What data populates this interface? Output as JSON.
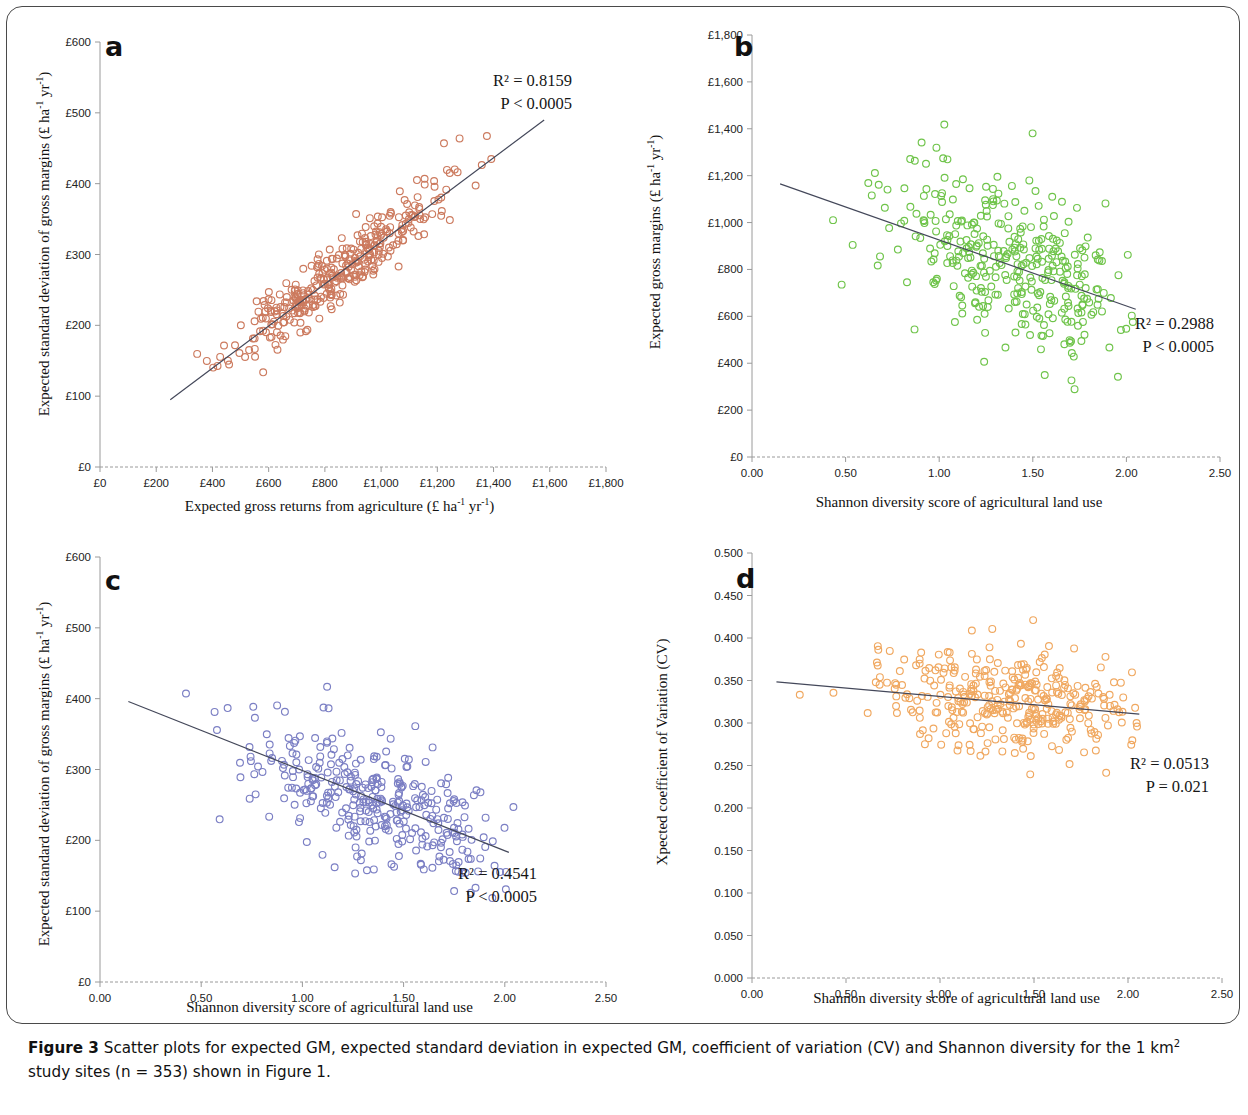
{
  "caption": {
    "prefix": "Figure 3",
    "text_part1": " Scatter plots for expected GM, expected standard deviation in expected GM, coefficient of variation (CV) and Shannon diversity for the 1 km",
    "superscript": "2",
    "text_part2": " study sites (n = 353) shown in Figure 1."
  },
  "colors": {
    "panel_a_marker": "#cc7a5e",
    "panel_b_marker": "#6fc44a",
    "panel_c_marker": "#7b7fc4",
    "panel_d_marker": "#f0a860",
    "trendline": "#44485a",
    "axis": "#9a9a9a",
    "text": "#111111"
  },
  "chart_data": [
    {
      "id": "panel-a",
      "type": "scatter",
      "letter": "a",
      "title": "",
      "xlabel": "Expected gross returns from agriculture (£ ha-1 yr-1)",
      "xlabel_display": "Expected gross returns from agriculture (£ ha",
      "ylabel": "Expected standard deviation of gross margins (£ ha-1 yr-1)",
      "ylabel_display": "Expected standard deviation of gross margins (£ ha",
      "xlim": [
        0,
        1800
      ],
      "ylim": [
        0,
        600
      ],
      "xticks": [
        "£0",
        "£200",
        "£400",
        "£600",
        "£800",
        "£1,000",
        "£1,200",
        "£1,400",
        "£1,600",
        "£1,800"
      ],
      "xtick_values": [
        0,
        200,
        400,
        600,
        800,
        1000,
        1200,
        1400,
        1600,
        1800
      ],
      "yticks": [
        "£0",
        "£100",
        "£200",
        "£300",
        "£400",
        "£500",
        "£600"
      ],
      "ytick_values": [
        0,
        100,
        200,
        300,
        400,
        500,
        600
      ],
      "r2_label": "R² = 0.8159",
      "r2_value": 0.8159,
      "p_label": "P < 0.0005",
      "grid": false,
      "legend": "none",
      "marker_color": "#cc7a5e",
      "trend": {
        "x0": 250,
        "y0": 95,
        "x1": 1580,
        "y1": 490
      },
      "n": 353,
      "seed": 11,
      "distribution": {
        "model": "linear_cluster",
        "x_mean": 840,
        "x_sd": 185,
        "x_min": 250,
        "x_max": 1590,
        "slope": 0.297,
        "intercept": 21,
        "resid_sd": 21
      }
    },
    {
      "id": "panel-b",
      "type": "scatter",
      "letter": "b",
      "title": "",
      "xlabel": "Shannon diversity score of agricultural land use",
      "ylabel": "Expected gross margins (£ ha-1 yr-1)",
      "ylabel_display": "Expected gross margins (£ ha",
      "xlim": [
        0,
        2.5
      ],
      "ylim": [
        0,
        1800
      ],
      "xticks": [
        "0.00",
        "0.50",
        "1.00",
        "1.50",
        "2.00",
        "2.50"
      ],
      "xtick_values": [
        0,
        0.5,
        1.0,
        1.5,
        2.0,
        2.5
      ],
      "yticks": [
        "£0",
        "£200",
        "£400",
        "£600",
        "£800",
        "£1,000",
        "£1,200",
        "£1,400",
        "£1,600",
        "£1,800"
      ],
      "ytick_values": [
        0,
        200,
        400,
        600,
        800,
        1000,
        1200,
        1400,
        1600,
        1800
      ],
      "r2_label": "R² = 0.2988",
      "r2_value": 0.2988,
      "p_label": "P < 0.0005",
      "grid": false,
      "legend": "none",
      "marker_color": "#6fc44a",
      "trend": {
        "x0": 0.15,
        "y0": 1165,
        "x1": 2.05,
        "y1": 630
      },
      "n": 353,
      "seed": 23,
      "distribution": {
        "model": "linear_cluster",
        "x_mean": 1.38,
        "x_sd": 0.33,
        "x_min": 0.14,
        "x_max": 2.05,
        "slope": -282,
        "intercept": 1207,
        "resid_sd": 175
      }
    },
    {
      "id": "panel-c",
      "type": "scatter",
      "letter": "c",
      "title": "",
      "xlabel": "Shannon diversity score of agricultural land use",
      "ylabel": "Expected standard deviation of gross margins (£ ha-1 yr-1)",
      "ylabel_display": "Expected standard deviation of gross margins (£ ha",
      "xlim": [
        0,
        2.5
      ],
      "ylim": [
        0,
        600
      ],
      "xticks": [
        "0.00",
        "0.50",
        "1.00",
        "1.50",
        "2.00",
        "2.50"
      ],
      "xtick_values": [
        0,
        0.5,
        1.0,
        1.5,
        2.0,
        2.5
      ],
      "yticks": [
        "£0",
        "£100",
        "£200",
        "£300",
        "£400",
        "£500",
        "£600"
      ],
      "ytick_values": [
        0,
        100,
        200,
        300,
        400,
        500,
        600
      ],
      "r2_label": "R² = 0.4541",
      "r2_value": 0.4541,
      "p_label": "P < 0.0005",
      "grid": false,
      "legend": "none",
      "marker_color": "#7b7fc4",
      "trend": {
        "x0": 0.14,
        "y0": 396,
        "x1": 2.02,
        "y1": 183
      },
      "n": 353,
      "seed": 37,
      "distribution": {
        "model": "linear_cluster",
        "x_mean": 1.38,
        "x_sd": 0.33,
        "x_min": 0.12,
        "x_max": 2.05,
        "slope": -113,
        "intercept": 412,
        "resid_sd": 43
      }
    },
    {
      "id": "panel-d",
      "type": "scatter",
      "letter": "d",
      "title": "",
      "xlabel": "Shannon diversity score of agricultural land use",
      "ylabel": "Xpected coefficient of Variation (CV)",
      "ylabel_display": "Xpected coefficient of Variation (CV)",
      "xlim": [
        0,
        2.5
      ],
      "ylim": [
        0,
        0.5
      ],
      "xticks": [
        "0.00",
        "0.50",
        "1.00",
        "1.50",
        "2.00",
        "2.50"
      ],
      "xtick_values": [
        0,
        0.5,
        1.0,
        1.5,
        2.0,
        2.5
      ],
      "yticks": [
        "0.000",
        "0.050",
        "0.100",
        "0.150",
        "0.200",
        "0.250",
        "0.300",
        "0.350",
        "0.400",
        "0.450",
        "0.500"
      ],
      "ytick_values": [
        0,
        0.05,
        0.1,
        0.15,
        0.2,
        0.25,
        0.3,
        0.35,
        0.4,
        0.45,
        0.5
      ],
      "r2_label": "R² = 0.0513",
      "r2_value": 0.0513,
      "p_label": "P = 0.021",
      "grid": false,
      "legend": "none",
      "marker_color": "#f0a860",
      "trend": {
        "x0": 0.13,
        "y0": 0.3485,
        "x1": 2.06,
        "y1": 0.3105
      },
      "n": 353,
      "seed": 53,
      "distribution": {
        "model": "linear_cluster",
        "x_mean": 1.38,
        "x_sd": 0.33,
        "x_min": 0.12,
        "x_max": 2.05,
        "slope": -0.0197,
        "intercept": 0.3511,
        "resid_sd": 0.0305
      }
    }
  ],
  "units_sup": {
    "ha_sup": "-1",
    "yr": " yr",
    "yr_sup": "-1",
    "close": ")"
  }
}
